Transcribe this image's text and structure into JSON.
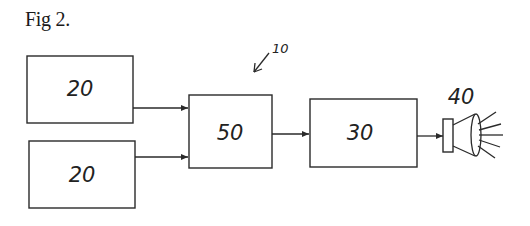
{
  "figure": {
    "title": "Fig 2."
  },
  "system": {
    "reference_label": "10"
  },
  "blocks": [
    {
      "id": "input-a",
      "label": "20"
    },
    {
      "id": "input-b",
      "label": "20"
    },
    {
      "id": "combiner",
      "label": "50"
    },
    {
      "id": "driver",
      "label": "30"
    }
  ],
  "lamp": {
    "label": "40",
    "icon": "lamp-light-icon"
  },
  "colors": {
    "stroke": "#2a2a2a",
    "background": "#ffffff"
  }
}
